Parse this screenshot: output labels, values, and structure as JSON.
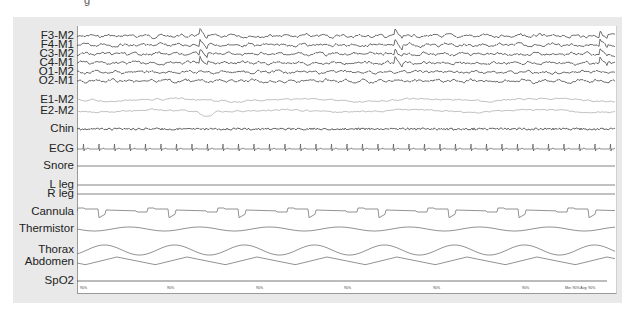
{
  "header_fragment": "g",
  "channels": [
    {
      "label": "F3-M2",
      "y": 36,
      "type": "eeg",
      "color": "#333333"
    },
    {
      "label": "F4-M1",
      "y": 45,
      "type": "eeg",
      "color": "#333333"
    },
    {
      "label": "C3-M2",
      "y": 54,
      "type": "eeg",
      "color": "#333333"
    },
    {
      "label": "C4-M1",
      "y": 63,
      "type": "eeg",
      "color": "#333333"
    },
    {
      "label": "O1-M2",
      "y": 72,
      "type": "eeg",
      "color": "#333333"
    },
    {
      "label": "O2-M1",
      "y": 81,
      "type": "eeg",
      "color": "#333333"
    },
    {
      "label": "E1-M2",
      "y": 100,
      "type": "eog",
      "color": "#a8a8a8"
    },
    {
      "label": "E2-M2",
      "y": 111,
      "type": "eog",
      "color": "#a8a8a8"
    },
    {
      "label": "Chin",
      "y": 129,
      "type": "emg",
      "color": "#444444"
    },
    {
      "label": "ECG",
      "y": 149,
      "type": "ecg",
      "color": "#555555"
    },
    {
      "label": "Snore",
      "y": 166,
      "type": "flat",
      "color": "#666666"
    },
    {
      "label": "L leg",
      "y": 185,
      "type": "flat",
      "color": "#666666"
    },
    {
      "label": "R leg",
      "y": 194,
      "type": "flat",
      "color": "#666666"
    },
    {
      "label": "Cannula",
      "y": 212,
      "type": "cannula",
      "color": "#777777"
    },
    {
      "label": "Thermistor",
      "y": 229,
      "type": "thermistor",
      "color": "#777777"
    },
    {
      "label": "Thorax",
      "y": 250,
      "type": "thorax",
      "color": "#777777"
    },
    {
      "label": "Abdomen",
      "y": 262,
      "type": "abdomen",
      "color": "#777777"
    },
    {
      "label": "SpO2",
      "y": 281,
      "type": "spo2",
      "color": "#555555"
    }
  ],
  "spo2": {
    "ticks": [
      {
        "x": 80,
        "label": "90%"
      },
      {
        "x": 167,
        "label": "90%"
      },
      {
        "x": 256,
        "label": "90%"
      },
      {
        "x": 344,
        "label": "90%"
      },
      {
        "x": 433,
        "label": "90%"
      },
      {
        "x": 522,
        "label": "90%"
      }
    ],
    "summary": "Min: 90%  Avg: 90%"
  },
  "events": {
    "arousal_x": [
      200,
      395,
      600
    ]
  },
  "colors": {
    "panel": "#e9e9e9",
    "plot_bg": "#ffffff",
    "axis": "#9a9a9a"
  }
}
